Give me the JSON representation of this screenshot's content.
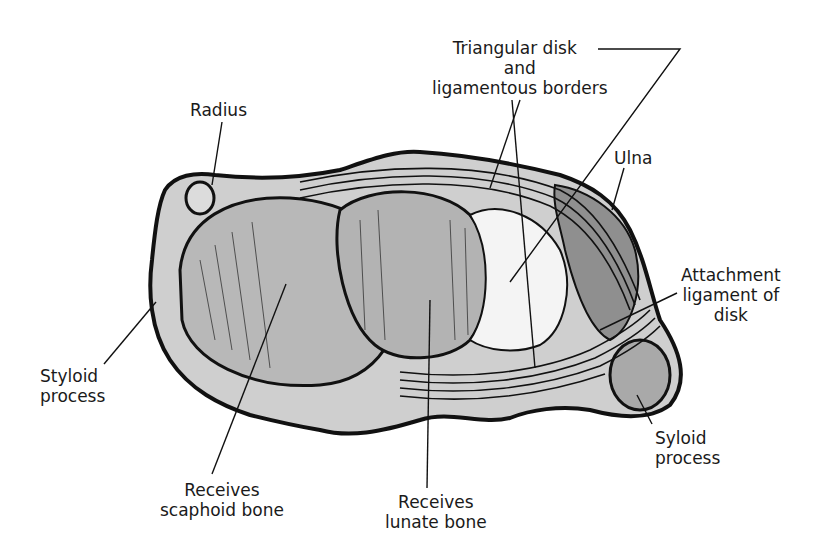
{
  "figure": {
    "colors": {
      "ink": "#111111",
      "bone_fill": "#bdbdbd",
      "disk_fill": "#f2f2f2",
      "background": "#ffffff"
    }
  },
  "labels": {
    "radius": {
      "lines": [
        "Radius"
      ]
    },
    "triangular_disk": {
      "lines": [
        "Triangular disk",
        "and",
        "ligamentous borders"
      ]
    },
    "ulna": {
      "lines": [
        "Ulna"
      ]
    },
    "attachment": {
      "lines": [
        "Attachment",
        "ligament of",
        "disk"
      ]
    },
    "styloid_left": {
      "lines": [
        "Styloid",
        "process"
      ]
    },
    "styloid_right": {
      "lines": [
        "Syloid",
        "process"
      ]
    },
    "scaphoid": {
      "lines": [
        "Receives",
        "scaphoid bone"
      ]
    },
    "lunate": {
      "lines": [
        "Receives",
        "lunate bone"
      ]
    }
  }
}
